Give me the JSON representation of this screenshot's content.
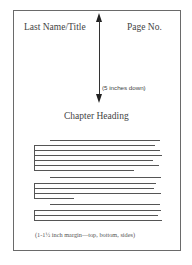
{
  "diagram": {
    "header_left": "Last Name/Title",
    "header_right": "Page No.",
    "distance_label": "(5 inches down)",
    "chapter_heading": "Chapter Heading",
    "margin_note": "(1-1½ inch margin—top, bottom, sides)",
    "arrow_icon": "double-headed-vertical-arrow",
    "colors": {
      "border": "#6a6a6a",
      "text": "#444444",
      "lines": "#555555"
    }
  }
}
